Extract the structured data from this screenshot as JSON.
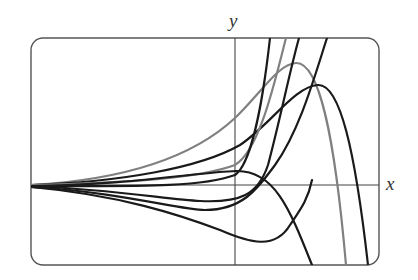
{
  "diagram": {
    "title": "",
    "axes": {
      "x_label": "x",
      "y_label": "y"
    },
    "frame": {
      "left": 31,
      "top": 38,
      "right": 379,
      "bottom": 265,
      "corner_radius": 12,
      "color": "#555555"
    },
    "origin": {
      "x": 235,
      "y": 185
    },
    "colors": {
      "black_curve": "#1a1a1a",
      "gray_curve": "#808080",
      "axis": "#444444"
    },
    "curves": [
      {
        "name": "gray-curve-rising-left",
        "color": "gray",
        "d": "M31,185 C120,180 190,160 235,118 C262,92 278,64 296,63 C320,62 335,140 346,265"
      },
      {
        "name": "black-curve-peak-right",
        "color": "black",
        "d": "M31,185 C120,182 200,168 240,145 C270,125 295,86 318,85 C340,84 355,150 368,265"
      },
      {
        "name": "gray-curve-steep",
        "color": "gray",
        "d": "M31,185 C130,183 200,178 235,165 C260,150 275,80 286,38"
      },
      {
        "name": "black-curve-steep-1",
        "color": "black",
        "d": "M31,186 C130,186 200,188 235,175 C250,165 262,110 270,38"
      },
      {
        "name": "black-curve-flat-hump",
        "color": "black",
        "d": "M31,186 C130,185 200,172 236,171 C275,170 290,210 312,265"
      },
      {
        "name": "black-curve-dip-up-1",
        "color": "black",
        "d": "M31,186 C120,190 170,200 200,201 C240,203 258,195 268,165 C280,120 290,70 299,38"
      },
      {
        "name": "black-curve-dip-up-2",
        "color": "black",
        "d": "M31,187 C120,192 180,210 205,210 C245,210 260,185 275,165 C300,130 315,75 327,38"
      },
      {
        "name": "black-curve-deep-dip",
        "color": "black",
        "d": "M31,187 C120,195 180,215 220,230 C250,243 275,250 290,225 C300,210 308,200 312,180"
      }
    ]
  }
}
